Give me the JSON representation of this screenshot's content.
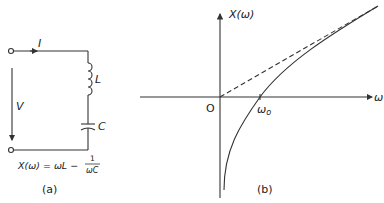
{
  "panel_a": {
    "current_label": "I",
    "inductor_label": "L",
    "capacitor_label": "C",
    "voltage_label": "V",
    "equation_lhs": "X(ω) = ωL −",
    "equation_num": "1",
    "equation_den": "ωC",
    "caption": "(a)"
  },
  "panel_b": {
    "y_axis_label": "X(ω)",
    "x_axis_label": "ω",
    "origin_label": "O",
    "resonance_label": "ω",
    "resonance_sub": "o",
    "caption": "(b)"
  },
  "colors": {
    "line": "#333333",
    "background": "#ffffff"
  }
}
